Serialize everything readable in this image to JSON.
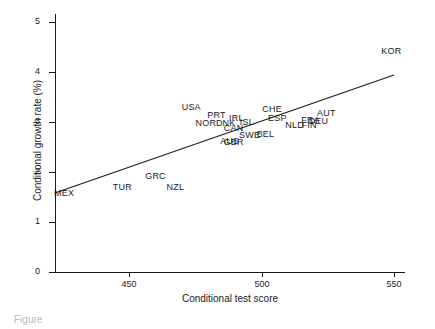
{
  "chart_data": {
    "type": "scatter",
    "title": "",
    "xlabel": "Conditional test score",
    "ylabel": "Conditional growth rate (%)",
    "xlim": [
      422,
      557
    ],
    "ylim": [
      0,
      5.2
    ],
    "xticks": [
      450,
      500,
      550
    ],
    "yticks": [
      0,
      1,
      2,
      3,
      4,
      5
    ],
    "xtick_labels": [
      "450",
      "500",
      "550"
    ],
    "ytick_labels": [
      "0",
      "1",
      "2",
      "3",
      "4",
      "5"
    ],
    "grid": false,
    "legend": "none",
    "marker_style": "text-label",
    "points": [
      {
        "label": "MEX",
        "x": 425.5,
        "y": 1.58
      },
      {
        "label": "TUR",
        "x": 447.5,
        "y": 1.7
      },
      {
        "label": "GRC",
        "x": 460.0,
        "y": 1.92
      },
      {
        "label": "NZL",
        "x": 467.5,
        "y": 1.7
      },
      {
        "label": "USA",
        "x": 473.5,
        "y": 3.3
      },
      {
        "label": "PRT",
        "x": 483.0,
        "y": 3.15
      },
      {
        "label": "NOR",
        "x": 479.0,
        "y": 2.98
      },
      {
        "label": "DNK",
        "x": 486.5,
        "y": 2.98
      },
      {
        "label": "IRL",
        "x": 490.5,
        "y": 3.08
      },
      {
        "label": "ISL",
        "x": 494.5,
        "y": 3.0
      },
      {
        "label": "CAN",
        "x": 489.5,
        "y": 2.88
      },
      {
        "label": "AUS",
        "x": 488.0,
        "y": 2.62
      },
      {
        "label": "GBR",
        "x": 489.5,
        "y": 2.6
      },
      {
        "label": "SWE",
        "x": 495.5,
        "y": 2.74
      },
      {
        "label": "BEL",
        "x": 501.5,
        "y": 2.77
      },
      {
        "label": "CHE",
        "x": 504.0,
        "y": 3.26
      },
      {
        "label": "ESP",
        "x": 506.0,
        "y": 3.08
      },
      {
        "label": "NLD",
        "x": 512.5,
        "y": 2.94
      },
      {
        "label": "FIN",
        "x": 518.0,
        "y": 2.94
      },
      {
        "label": "FRA",
        "x": 518.5,
        "y": 3.04
      },
      {
        "label": "DEU",
        "x": 521.5,
        "y": 3.03
      },
      {
        "label": "AUT",
        "x": 524.5,
        "y": 3.18
      },
      {
        "label": "KOR",
        "x": 549.0,
        "y": 4.42
      }
    ],
    "fit_line": {
      "name": "linear fit",
      "x_start": 422.0,
      "y_start": 1.58,
      "x_end": 550.0,
      "y_end": 3.94
    }
  },
  "caption": {
    "text": "Figure"
  }
}
